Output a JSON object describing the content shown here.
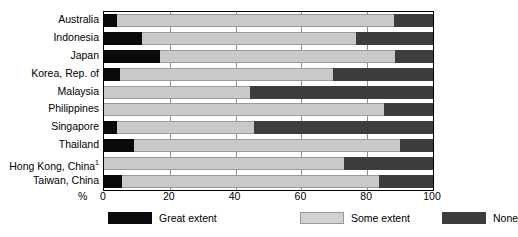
{
  "chart_data": {
    "type": "bar",
    "orientation": "horizontal",
    "stacked": true,
    "title": "",
    "xlabel": "%",
    "ylabel": "",
    "xlim": [
      0,
      100
    ],
    "xticks": [
      0,
      20,
      40,
      60,
      80,
      100
    ],
    "grid": true,
    "legend_position": "bottom",
    "categories": [
      "Australia",
      "Indonesia",
      "Japan",
      "Korea, Rep. of",
      "Malaysia",
      "Philippines",
      "Singapore",
      "Thailand",
      "Hong Kong, China",
      "Taiwan, China"
    ],
    "category_footnotes": {
      "Hong Kong, China": "1"
    },
    "series": [
      {
        "name": "Great extent",
        "color": "#0a0a0a",
        "values": [
          4,
          11.5,
          17,
          5,
          0,
          0,
          4,
          9,
          0,
          5.5
        ]
      },
      {
        "name": "Some extent",
        "color": "#c9c9c9",
        "values": [
          84,
          65,
          71.5,
          64.5,
          44.5,
          85,
          41.5,
          81,
          73,
          78
        ]
      },
      {
        "name": "None",
        "color": "#3d3d3d",
        "values": [
          12,
          23.5,
          11.5,
          30.5,
          55.5,
          15,
          54.5,
          10,
          27,
          16.5
        ]
      }
    ]
  },
  "legend": [
    {
      "label": "Great extent",
      "swatch": "great"
    },
    {
      "label": "Some extent",
      "swatch": "some"
    },
    {
      "label": "None",
      "swatch": "none"
    }
  ],
  "axis": {
    "x_unit_mark": "%",
    "tick_labels": [
      "0",
      "20",
      "40",
      "60",
      "80",
      "100"
    ]
  }
}
